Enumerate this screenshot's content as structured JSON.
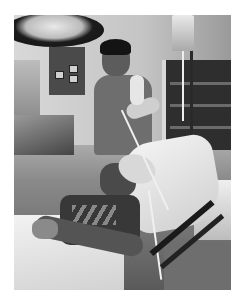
{
  "image": {
    "type": "photograph",
    "color_mode": "black-and-white",
    "description": "Hospital room: a doctor in scrubs holds a manual resuscitation bag connected to an oxygen mask on a patient lying in a hospital bed",
    "elements": [
      "surgical lamp",
      "wall panel with outlets",
      "IV bag on pole",
      "medical cabinet",
      "doctor in scrubs with stethoscope",
      "resuscitation bag",
      "patient with oxygen mask",
      "white pillow",
      "hospital bed rails",
      "white sheet"
    ]
  },
  "colors": {
    "background": "#ffffff",
    "dark": "#1a1a1a",
    "light": "#f2f2f2"
  }
}
